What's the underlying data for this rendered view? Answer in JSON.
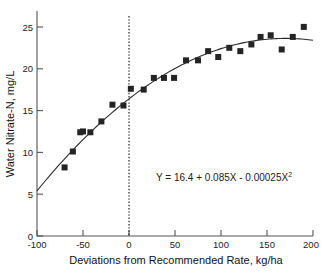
{
  "chart_data": {
    "type": "scatter",
    "title": "",
    "xlabel": "Deviations from Recommended Rate, kg/ha",
    "ylabel": "Water Nitrate-N, mg/L",
    "xlim": [
      -100,
      200
    ],
    "ylim": [
      0,
      26.9
    ],
    "xticks": [
      -100,
      -50,
      0,
      50,
      100,
      150,
      200
    ],
    "xticklabels": [
      "-100",
      "-50",
      "0",
      "50",
      "100",
      "150",
      "200"
    ],
    "yticks": [
      0,
      5,
      10,
      15,
      20,
      25
    ],
    "yticklabels": [
      "0",
      "5",
      "10",
      "15",
      "20",
      "25"
    ],
    "grid": false,
    "legend": null,
    "marker": "filled-square",
    "marker_color": "#242424",
    "curve_color": "#2b2b2b",
    "points": [
      {
        "x": -70,
        "y": 8.2
      },
      {
        "x": -61,
        "y": 10.1
      },
      {
        "x": -53,
        "y": 12.4
      },
      {
        "x": -50,
        "y": 12.5
      },
      {
        "x": -42,
        "y": 12.4
      },
      {
        "x": -30,
        "y": 13.7
      },
      {
        "x": -18,
        "y": 15.7
      },
      {
        "x": -6,
        "y": 15.6
      },
      {
        "x": 2,
        "y": 17.6
      },
      {
        "x": 16,
        "y": 17.5
      },
      {
        "x": 27,
        "y": 18.9
      },
      {
        "x": 38,
        "y": 18.9
      },
      {
        "x": 49,
        "y": 18.9
      },
      {
        "x": 62,
        "y": 21.0
      },
      {
        "x": 75,
        "y": 21.0
      },
      {
        "x": 86,
        "y": 22.1
      },
      {
        "x": 97,
        "y": 21.4
      },
      {
        "x": 109,
        "y": 22.5
      },
      {
        "x": 121,
        "y": 22.1
      },
      {
        "x": 133,
        "y": 22.9
      },
      {
        "x": 143,
        "y": 23.8
      },
      {
        "x": 154,
        "y": 24.0
      },
      {
        "x": 166,
        "y": 22.3
      },
      {
        "x": 178,
        "y": 23.8
      },
      {
        "x": 190,
        "y": 25.0
      }
    ],
    "fit": {
      "equation_text": "Y = 16.4 + 0.085X - 0.00025X",
      "equation_exponent": "2",
      "intercept": 16.4,
      "linear_coefficient": 0.085,
      "quadratic_coefficient": -0.00025,
      "x_range": [
        -100,
        200
      ]
    },
    "reference_line": {
      "type": "vertical-dotted",
      "x": 0,
      "label": ""
    },
    "annotations": [
      {
        "name": "regression-equation",
        "text": "Y = 16.4 + 0.085X - 0.00025X2",
        "x": 60,
        "y": 9.0
      }
    ]
  }
}
